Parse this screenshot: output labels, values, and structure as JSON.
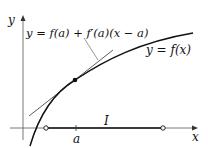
{
  "diagram": {
    "labels": {
      "y_axis": "y",
      "x_axis": "x",
      "tangent_eq": "y = f(a) + f′(a)(x − a)",
      "curve_eq": "y = f(x)",
      "point": "a",
      "interval": "I"
    },
    "colors": {
      "stroke": "#111111",
      "tangent": "#333333",
      "axis": "#555555"
    }
  }
}
